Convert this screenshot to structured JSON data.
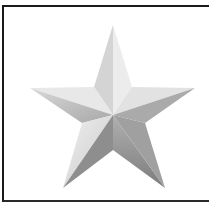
{
  "image": {
    "subject": "star-icon",
    "description": "Five-pointed 3D beveled silver star inside a black-bordered frame",
    "colors": {
      "frame_border": "#1a1a1a",
      "background": "#ffffff",
      "facet_light": "#e6e6e6",
      "facet_mid": "#c4c4c4",
      "facet_dark": "#8e8e8e",
      "facet_darker": "#7a7a7a"
    }
  }
}
